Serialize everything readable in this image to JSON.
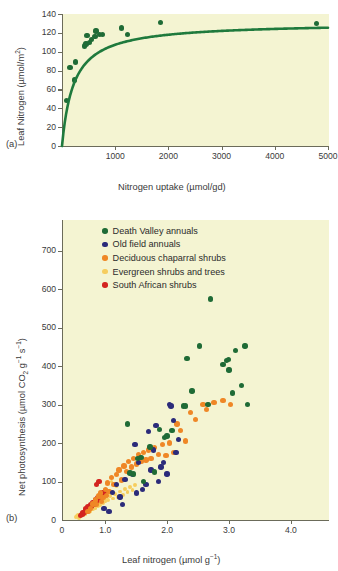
{
  "figure": {
    "panel_a_label": "(a)",
    "panel_b_label": "(b)"
  },
  "chart_data": [
    {
      "type": "scatter",
      "panel": "(a)",
      "title": "",
      "xlabel": "Nitrogen uptake (µmol/gd)",
      "ylabel": "Leaf Nitrogen (µmol/m²)",
      "xlim": [
        0,
        5000
      ],
      "ylim": [
        0,
        140
      ],
      "xticks": [
        0,
        1000,
        2000,
        3000,
        4000,
        5000
      ],
      "xtick_labels": [
        "0",
        "1000",
        "2000",
        "3000",
        "4000",
        "5000"
      ],
      "yticks": [
        0,
        20,
        40,
        60,
        80,
        100,
        120,
        140
      ],
      "ytick_labels": [
        "0",
        "20",
        "40",
        "60",
        "80",
        "100",
        "120",
        "140"
      ],
      "grid": false,
      "legend": "none",
      "marker_color": "#1f6b36",
      "line_color": "#1f7a3d",
      "points": [
        {
          "x": 90,
          "y": 48
        },
        {
          "x": 150,
          "y": 83
        },
        {
          "x": 230,
          "y": 70
        },
        {
          "x": 250,
          "y": 89
        },
        {
          "x": 420,
          "y": 106
        },
        {
          "x": 450,
          "y": 108
        },
        {
          "x": 470,
          "y": 117
        },
        {
          "x": 520,
          "y": 110
        },
        {
          "x": 560,
          "y": 113
        },
        {
          "x": 620,
          "y": 116
        },
        {
          "x": 640,
          "y": 122
        },
        {
          "x": 700,
          "y": 118
        },
        {
          "x": 760,
          "y": 118
        },
        {
          "x": 1120,
          "y": 125
        },
        {
          "x": 1230,
          "y": 118
        },
        {
          "x": 1850,
          "y": 131
        },
        {
          "x": 4780,
          "y": 130
        }
      ],
      "fit_curve": {
        "description": "saturating Michaelis-Menten style rise to asymptote ~131",
        "asymptote": 131,
        "half_saturation": 220
      }
    },
    {
      "type": "scatter",
      "panel": "(b)",
      "title": "",
      "xlabel": "Leaf nitrogen (µmol g⁻¹)",
      "ylabel": "Net photosynthesis (µmol CO₂ g⁻¹ s⁻¹)",
      "xlim": [
        0.3,
        4.6
      ],
      "ylim": [
        0,
        780
      ],
      "xticks": [
        0.3,
        1.0,
        2.0,
        3.0,
        4.0
      ],
      "xtick_labels": [
        "0",
        "1.0",
        "2.0",
        "3.0",
        "4.0"
      ],
      "yticks": [
        100,
        200,
        300,
        400,
        500,
        600,
        700
      ],
      "ytick_labels": [
        "100",
        "200",
        "300",
        "400",
        "500",
        "600",
        "700"
      ],
      "grid": false,
      "legend_position": "upper-left",
      "series": [
        {
          "name": "Death Valley annuals",
          "color": "#1f6b36",
          "points": [
            [
              1.52,
              160
            ],
            [
              1.58,
              163
            ],
            [
              1.72,
              190
            ],
            [
              1.8,
              125
            ],
            [
              1.88,
              235
            ],
            [
              1.96,
              215
            ],
            [
              2.0,
              218
            ],
            [
              2.08,
              232
            ],
            [
              2.26,
              296
            ],
            [
              2.3,
              296
            ],
            [
              2.32,
              420
            ],
            [
              2.4,
              335
            ],
            [
              2.52,
              452
            ],
            [
              2.66,
              300
            ],
            [
              2.7,
              575
            ],
            [
              2.9,
              405
            ],
            [
              2.96,
              415
            ],
            [
              2.99,
              418
            ],
            [
              3.0,
              390
            ],
            [
              3.06,
              330
            ],
            [
              3.1,
              440
            ],
            [
              3.2,
              350
            ],
            [
              3.26,
              452
            ],
            [
              3.3,
              300
            ],
            [
              1.36,
              250
            ],
            [
              1.4,
              122
            ],
            [
              1.46,
              120
            ],
            [
              1.62,
              100
            ]
          ]
        },
        {
          "name": "Old field annuals",
          "color": "#2b2b7a",
          "points": [
            [
              1.32,
              105
            ],
            [
              1.5,
              70
            ],
            [
              1.54,
              150
            ],
            [
              1.6,
              80
            ],
            [
              1.66,
              92
            ],
            [
              1.7,
              230
            ],
            [
              1.74,
              130
            ],
            [
              1.78,
              182
            ],
            [
              1.82,
              245
            ],
            [
              1.86,
              100
            ],
            [
              1.9,
              138
            ],
            [
              1.94,
              150
            ],
            [
              2.0,
              120
            ],
            [
              2.04,
              300
            ],
            [
              2.06,
              296
            ],
            [
              2.1,
              258
            ],
            [
              2.14,
              175
            ],
            [
              2.18,
              210
            ],
            [
              1.24,
              60
            ],
            [
              1.28,
              40
            ],
            [
              1.18,
              92
            ],
            [
              1.12,
              72
            ],
            [
              1.44,
              118
            ],
            [
              1.48,
              196
            ],
            [
              0.98,
              30
            ],
            [
              1.06,
              22
            ]
          ]
        },
        {
          "name": "Deciduous chaparral shrubs",
          "color": "#ef8726",
          "points": [
            [
              0.72,
              22
            ],
            [
              0.76,
              30
            ],
            [
              0.8,
              42
            ],
            [
              0.84,
              52
            ],
            [
              0.86,
              40
            ],
            [
              0.9,
              62
            ],
            [
              0.92,
              70
            ],
            [
              0.96,
              58
            ],
            [
              1.0,
              80
            ],
            [
              1.04,
              96
            ],
            [
              1.06,
              74
            ],
            [
              1.1,
              110
            ],
            [
              1.14,
              92
            ],
            [
              1.18,
              118
            ],
            [
              1.22,
              130
            ],
            [
              1.26,
              104
            ],
            [
              1.3,
              140
            ],
            [
              1.34,
              126
            ],
            [
              1.38,
              152
            ],
            [
              1.42,
              138
            ],
            [
              1.46,
              160
            ],
            [
              1.5,
              146
            ],
            [
              1.54,
              170
            ],
            [
              1.58,
              152
            ],
            [
              1.62,
              176
            ],
            [
              1.66,
              156
            ],
            [
              1.7,
              182
            ],
            [
              1.74,
              160
            ],
            [
              1.8,
              188
            ],
            [
              1.86,
              170
            ],
            [
              1.92,
              196
            ],
            [
              1.98,
              168
            ],
            [
              2.04,
              200
            ],
            [
              2.1,
              176
            ],
            [
              2.16,
              250
            ],
            [
              2.22,
              232
            ],
            [
              2.3,
              205
            ],
            [
              2.38,
              280
            ],
            [
              2.46,
              262
            ],
            [
              2.58,
              300
            ],
            [
              2.64,
              288
            ],
            [
              2.76,
              306
            ],
            [
              2.9,
              310
            ],
            [
              3.02,
              300
            ],
            [
              1.02,
              64
            ],
            [
              0.94,
              48
            ]
          ]
        },
        {
          "name": "Evergreen shrubs and trees",
          "color": "#f6cd5e",
          "points": [
            [
              0.52,
              8
            ],
            [
              0.56,
              12
            ],
            [
              0.6,
              10
            ],
            [
              0.62,
              18
            ],
            [
              0.64,
              14
            ],
            [
              0.66,
              22
            ],
            [
              0.68,
              16
            ],
            [
              0.7,
              26
            ],
            [
              0.72,
              20
            ],
            [
              0.74,
              30
            ],
            [
              0.76,
              24
            ],
            [
              0.78,
              34
            ],
            [
              0.8,
              28
            ],
            [
              0.82,
              38
            ],
            [
              0.84,
              32
            ],
            [
              0.86,
              42
            ],
            [
              0.88,
              36
            ],
            [
              0.9,
              46
            ],
            [
              0.92,
              40
            ],
            [
              0.94,
              50
            ],
            [
              0.96,
              44
            ],
            [
              0.98,
              54
            ],
            [
              1.0,
              48
            ],
            [
              1.02,
              58
            ],
            [
              1.04,
              52
            ],
            [
              1.08,
              62
            ],
            [
              1.12,
              56
            ],
            [
              1.16,
              68
            ],
            [
              1.2,
              60
            ],
            [
              1.24,
              74
            ],
            [
              1.28,
              66
            ],
            [
              1.32,
              80
            ],
            [
              1.36,
              72
            ],
            [
              1.4,
              86
            ],
            [
              1.44,
              78
            ],
            [
              1.48,
              92
            ],
            [
              0.58,
              6
            ],
            [
              0.54,
              10
            ],
            [
              1.1,
              100
            ],
            [
              1.18,
              88
            ]
          ]
        },
        {
          "name": "South African shrubs",
          "color": "#d32420",
          "points": [
            [
              0.62,
              14
            ],
            [
              0.66,
              20
            ],
            [
              0.68,
              28
            ],
            [
              0.7,
              24
            ],
            [
              0.72,
              34
            ],
            [
              0.74,
              30
            ],
            [
              0.76,
              40
            ],
            [
              0.78,
              36
            ],
            [
              0.8,
              46
            ],
            [
              0.82,
              42
            ],
            [
              0.84,
              52
            ],
            [
              0.86,
              48
            ],
            [
              0.88,
              58
            ],
            [
              0.9,
              54
            ],
            [
              0.92,
              64
            ],
            [
              0.94,
              60
            ],
            [
              0.96,
              70
            ],
            [
              0.98,
              66
            ],
            [
              1.0,
              76
            ],
            [
              0.64,
              18
            ],
            [
              0.6,
              12
            ],
            [
              0.86,
              92
            ],
            [
              0.9,
              100
            ]
          ]
        }
      ]
    }
  ],
  "panel_a": {
    "label": "(a)",
    "ylabel_main": "Leaf Nitrogen  (µmol/m",
    "ylabel_sup": "2",
    "ylabel_close": ")",
    "xlabel": "Nitrogen uptake (µmol/gd)"
  },
  "panel_b": {
    "label": "(b)",
    "ylabel_pre": "Net photosynthesis (µmol CO",
    "ylabel_sub1": "2",
    "ylabel_mid": " g",
    "ylabel_sup1": "−1",
    "ylabel_mid2": " s",
    "ylabel_sup2": "−1",
    "ylabel_close": ")",
    "xlabel_pre": "Leaf nitrogen (µmol g",
    "xlabel_sup": "−1",
    "xlabel_close": ")",
    "legend": [
      {
        "label": "Death Valley annuals",
        "color": "#1f6b36"
      },
      {
        "label": "Old field annuals",
        "color": "#2b2b7a"
      },
      {
        "label": "Deciduous chaparral shrubs",
        "color": "#ef8726"
      },
      {
        "label": "Evergreen shrubs and trees",
        "color": "#f6cd5e"
      },
      {
        "label": "South African shrubs",
        "color": "#d32420"
      }
    ]
  }
}
